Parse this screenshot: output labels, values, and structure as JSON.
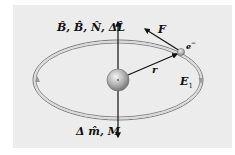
{
  "diagram": {
    "type": "orbital-electron-diagram",
    "labels": {
      "top_axis": "B̂, B̂̇, N̂, ΔL̂",
      "bottom_axis": "Δ m̂, M",
      "force": "F",
      "electron": "e",
      "electron_charge": "−",
      "radius": "r",
      "energy": "E",
      "energy_sub": "1"
    },
    "colors": {
      "background": "#ececec",
      "orbit": "#7a7a7a",
      "orbit_inner": "#b4b4b4",
      "arrow": "#111111",
      "nucleus": "#a8a8a8"
    }
  }
}
